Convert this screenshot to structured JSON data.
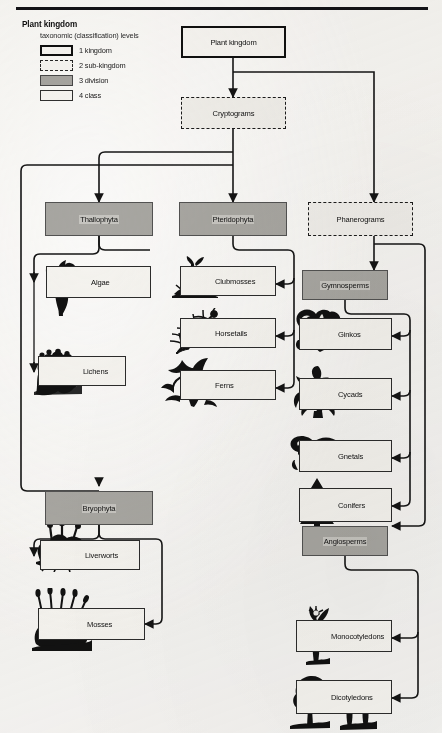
{
  "page": {
    "folio": "",
    "background_color": "#efeeec",
    "ink_color": "#161616",
    "division_fill": "#aaa9a5"
  },
  "legend": {
    "title": "Plant kingdom",
    "subtitle": "taxonomic (classification) levels",
    "items": [
      {
        "rank": "1",
        "label": "1  kingdom",
        "style": "solid-thick"
      },
      {
        "rank": "2",
        "label": "2  sub-kingdom",
        "style": "dashed"
      },
      {
        "rank": "3",
        "label": "3  division",
        "style": "filled-gray"
      },
      {
        "rank": "4",
        "label": "4  class",
        "style": "solid-thin"
      }
    ]
  },
  "diagram": {
    "type": "hierarchy-flowchart",
    "root": "Plant kingdom",
    "nodes": [
      {
        "id": "plant-kingdom",
        "label": "Plant kingdom",
        "level": "kingdom"
      },
      {
        "id": "cryptograms",
        "label": "Cryptograms",
        "level": "sub-kingdom"
      },
      {
        "id": "phanerograms",
        "label": "Phanerograms",
        "level": "sub-kingdom"
      },
      {
        "id": "thallophyta",
        "label": "Thallophyta",
        "level": "division"
      },
      {
        "id": "pteridophyta",
        "label": "Pteridophyta",
        "level": "division"
      },
      {
        "id": "bryophyta",
        "label": "Bryophyta",
        "level": "division"
      },
      {
        "id": "gymnosperms",
        "label": "Gymnosperms",
        "level": "division"
      },
      {
        "id": "angiosperms",
        "label": "Angiosperms",
        "level": "division"
      },
      {
        "id": "algae",
        "label": "Algae",
        "level": "class"
      },
      {
        "id": "lichens",
        "label": "Lichens",
        "level": "class"
      },
      {
        "id": "clubmosses",
        "label": "Clubmosses",
        "level": "class"
      },
      {
        "id": "horsetails",
        "label": "Horsetails",
        "level": "class"
      },
      {
        "id": "ferns",
        "label": "Ferns",
        "level": "class"
      },
      {
        "id": "liverworts",
        "label": "Liverworts",
        "level": "class"
      },
      {
        "id": "mosses",
        "label": "Mosses",
        "level": "class"
      },
      {
        "id": "ginkos",
        "label": "Ginkos",
        "level": "class"
      },
      {
        "id": "cycads",
        "label": "Cycads",
        "level": "class"
      },
      {
        "id": "gnetals",
        "label": "Gnetals",
        "level": "class"
      },
      {
        "id": "conifers",
        "label": "Conifers",
        "level": "class"
      },
      {
        "id": "monocotyledons",
        "label": "Monocotyledons",
        "level": "class"
      },
      {
        "id": "dicotyledons",
        "label": "Dicotyledons",
        "level": "class"
      }
    ],
    "edges": [
      {
        "from": "plant-kingdom",
        "to": "cryptograms"
      },
      {
        "from": "plant-kingdom",
        "to": "phanerograms"
      },
      {
        "from": "cryptograms",
        "to": "thallophyta"
      },
      {
        "from": "cryptograms",
        "to": "pteridophyta"
      },
      {
        "from": "cryptograms",
        "to": "bryophyta"
      },
      {
        "from": "phanerograms",
        "to": "gymnosperms"
      },
      {
        "from": "phanerograms",
        "to": "angiosperms"
      },
      {
        "from": "thallophyta",
        "to": "algae"
      },
      {
        "from": "thallophyta",
        "to": "lichens"
      },
      {
        "from": "pteridophyta",
        "to": "clubmosses"
      },
      {
        "from": "pteridophyta",
        "to": "horsetails"
      },
      {
        "from": "pteridophyta",
        "to": "ferns"
      },
      {
        "from": "bryophyta",
        "to": "liverworts"
      },
      {
        "from": "bryophyta",
        "to": "mosses"
      },
      {
        "from": "gymnosperms",
        "to": "ginkos"
      },
      {
        "from": "gymnosperms",
        "to": "cycads"
      },
      {
        "from": "gymnosperms",
        "to": "gnetals"
      },
      {
        "from": "gymnosperms",
        "to": "conifers"
      },
      {
        "from": "angiosperms",
        "to": "monocotyledons"
      },
      {
        "from": "angiosperms",
        "to": "dicotyledons"
      }
    ],
    "illustrations": [
      "algae-silhouette",
      "lichens-silhouette",
      "clubmoss-silhouette",
      "horsetail-silhouette",
      "fern-silhouette",
      "liverwort-silhouette",
      "moss-silhouette",
      "ginko-silhouette",
      "cycad-silhouette",
      "gnetal-silhouette",
      "conifer-silhouette",
      "monocot-silhouette",
      "dicot-silhouette"
    ]
  }
}
